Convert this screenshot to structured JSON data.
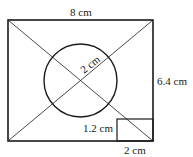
{
  "diagram": {
    "type": "geometry-figure",
    "labels": {
      "top_width": "8 cm",
      "right_height": "6.4 cm",
      "circle_radius": "2 cm",
      "small_rect_height": "1.2 cm",
      "small_rect_width": "2 cm"
    },
    "shapes": {
      "outer_rectangle": {
        "width_cm": 8,
        "height_cm": 6.4
      },
      "circle": {
        "radius_cm": 2
      },
      "corner_rectangle": {
        "width_cm": 2,
        "height_cm": 1.2
      },
      "diagonals": 2
    },
    "stroke_color": "#1a1a1a"
  }
}
